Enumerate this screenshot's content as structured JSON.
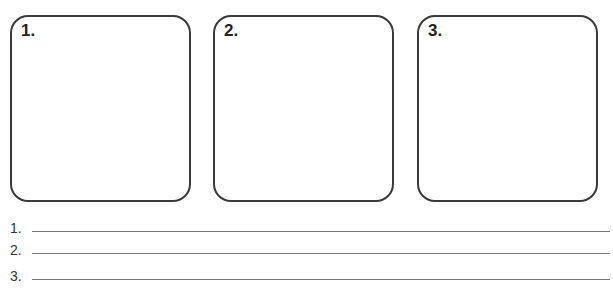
{
  "panels": [
    {
      "label": "1."
    },
    {
      "label": "2."
    },
    {
      "label": "3."
    }
  ],
  "answer_lines": [
    {
      "label": "1.",
      "value": ""
    },
    {
      "label": "2.",
      "value": ""
    },
    {
      "label": "3.",
      "value": ""
    }
  ]
}
